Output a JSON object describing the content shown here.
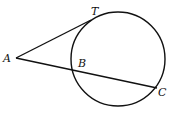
{
  "diagram": {
    "type": "geometry",
    "circle": {
      "cx": 118,
      "cy": 59,
      "r": 47
    },
    "points": {
      "A": {
        "label": "A",
        "x": 16,
        "y": 58
      },
      "T": {
        "label": "T",
        "x": 91,
        "y": 20
      },
      "B": {
        "label": "B",
        "x": 72,
        "y": 70
      },
      "C": {
        "label": "C",
        "x": 157,
        "y": 88
      }
    },
    "segments": [
      {
        "from": "A",
        "to": "T",
        "kind": "tangent"
      },
      {
        "from": "A",
        "to": "C",
        "kind": "secant",
        "through": "B"
      }
    ],
    "line_color": "#111111",
    "background": "#ffffff"
  }
}
